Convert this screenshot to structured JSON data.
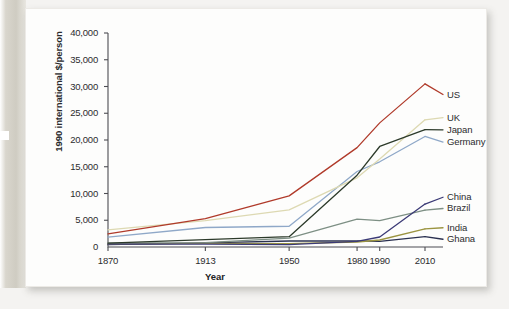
{
  "figure": {
    "background_color": "#f4f3f1",
    "card_color": "#fdfdfc"
  },
  "chart_data": {
    "type": "line",
    "title": "",
    "xlabel": "Year",
    "ylabel": "1990 international $/person",
    "x": [
      1870,
      1913,
      1950,
      1980,
      1990,
      2010
    ],
    "x_tick_labels": [
      "1870",
      "1913",
      "1950",
      "1980",
      "1990",
      "2010"
    ],
    "y_tick_labels": [
      "0",
      "5,000",
      "10,000",
      "15,000",
      "20,000",
      "25,000",
      "30,000",
      "35,000",
      "40,000"
    ],
    "y_ticks": [
      0,
      5000,
      10000,
      15000,
      20000,
      25000,
      30000,
      35000,
      40000
    ],
    "ylim": [
      0,
      40000
    ],
    "grid": false,
    "legend_position": "right-of-axes-inline",
    "series": [
      {
        "name": "US",
        "color": "#b03a2a",
        "values": [
          2445,
          5301,
          9561,
          18577,
          23201,
          30491
        ],
        "label_y_value": 28500
      },
      {
        "name": "UK",
        "color": "#ddd9b2",
        "values": [
          3190,
          4921,
          6939,
          12931,
          16430,
          23777
        ],
        "label_y_value": 24200
      },
      {
        "name": "Japan",
        "color": "#2c3a2a",
        "values": [
          737,
          1387,
          1921,
          13428,
          18789,
          21935
        ],
        "label_y_value": 21900
      },
      {
        "name": "Germany",
        "color": "#8fa8c8",
        "values": [
          1839,
          3648,
          3881,
          14114,
          15929,
          20661
        ],
        "label_y_value": 19600
      },
      {
        "name": "China",
        "color": "#3b3a76",
        "values": [
          530,
          552,
          448,
          1061,
          1871,
          8032
        ],
        "label_y_value": 9300
      },
      {
        "name": "Brazil",
        "color": "#7d8f84",
        "values": [
          713,
          811,
          1672,
          5195,
          4920,
          6879
        ],
        "label_y_value": 7200
      },
      {
        "name": "India",
        "color": "#9b9440",
        "values": [
          533,
          673,
          619,
          938,
          1309,
          3372
        ],
        "label_y_value": 3600
      },
      {
        "name": "Ghana",
        "color": "#2a3050",
        "values": [
          439,
          781,
          1122,
          1157,
          1063,
          1922
        ],
        "label_y_value": 1450
      }
    ]
  },
  "axes": {
    "axis_line_color": "#4d4d52",
    "text_color": "#2c2c2e"
  }
}
